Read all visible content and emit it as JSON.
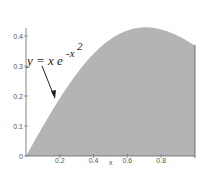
{
  "chart_data": {
    "type": "area",
    "title": "",
    "annotation": {
      "base": "y = x e",
      "exponent": "-x",
      "exp_power": "2"
    },
    "xlabel": "x",
    "ylabel": "",
    "xlim": [
      0,
      1
    ],
    "ylim": [
      0,
      0.43
    ],
    "x_ticks": [
      "0.2",
      "0.4",
      "0.6",
      "0.8"
    ],
    "y_ticks": [
      "0",
      "0.1",
      "0.2",
      "0.3",
      "0.4"
    ],
    "x": [
      0,
      0.1,
      0.2,
      0.3,
      0.4,
      0.5,
      0.6,
      0.7,
      0.8,
      0.9,
      1.0
    ],
    "values": [
      0,
      0.099,
      0.192,
      0.274,
      0.341,
      0.389,
      0.419,
      0.429,
      0.422,
      0.4,
      0.368
    ],
    "fill_color": "#b4b4b4",
    "grid": false
  }
}
